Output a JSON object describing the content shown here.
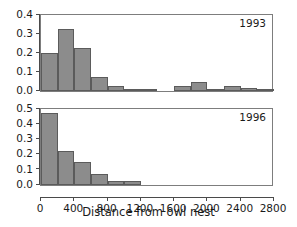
{
  "figure": {
    "xlabel": "Distance from owl nest",
    "bar_color": "#8c8c8c",
    "bar_edge_color": "#5b5b5b",
    "axis_color": "#4a4a4a",
    "text_color": "#1a1a1a"
  },
  "xaxis": {
    "min": 0,
    "max": 2800,
    "bin_width": 200,
    "tick_values": [
      0,
      400,
      800,
      1200,
      1600,
      2000,
      2400,
      2800
    ],
    "tick_labels": [
      "0",
      "400",
      "800",
      "1200",
      "1600",
      "2000",
      "2400",
      "2800"
    ]
  },
  "panels": [
    {
      "id": "1993",
      "annotation": "1993",
      "ylim": [
        0,
        0.4
      ],
      "ytick_values": [
        0.0,
        0.1,
        0.2,
        0.3,
        0.4
      ],
      "ytick_labels": [
        "0.0",
        "0.1",
        "0.2",
        "0.3",
        "0.4"
      ]
    },
    {
      "id": "1996",
      "annotation": "1996",
      "ylim": [
        0,
        0.5
      ],
      "ytick_values": [
        0.0,
        0.1,
        0.2,
        0.3,
        0.4,
        0.5
      ],
      "ytick_labels": [
        "0.0",
        "0.1",
        "0.2",
        "0.3",
        "0.4",
        "0.5"
      ]
    }
  ],
  "chart_data": [
    {
      "type": "bar",
      "title": "1993",
      "xlabel": "Distance from owl nest",
      "ylabel": "",
      "xlim": [
        0,
        2800
      ],
      "ylim": [
        0,
        0.4
      ],
      "grid": false,
      "legend": "none",
      "bin_width": 200,
      "bin_starts": [
        0,
        200,
        400,
        600,
        800,
        1000,
        1200,
        1400,
        1600,
        1800,
        2000,
        2200,
        2400,
        2600
      ],
      "categories": [
        "0-200",
        "200-400",
        "400-600",
        "600-800",
        "800-1000",
        "1000-1200",
        "1200-1400",
        "1400-1600",
        "1600-1800",
        "1800-2000",
        "2000-2200",
        "2200-2400",
        "2400-2600",
        "2600-2800"
      ],
      "values": [
        0.2,
        0.325,
        0.225,
        0.075,
        0.025,
        0.0125,
        0.0125,
        0.0,
        0.025,
        0.05,
        0.0125,
        0.025,
        0.0175,
        0.01
      ],
      "xtick_labels": [
        "0",
        "400",
        "800",
        "1200",
        "1600",
        "2000",
        "2400",
        "2800"
      ],
      "ytick_labels": [
        "0.0",
        "0.1",
        "0.2",
        "0.3",
        "0.4"
      ]
    },
    {
      "type": "bar",
      "title": "1996",
      "xlabel": "Distance from owl nest",
      "ylabel": "",
      "xlim": [
        0,
        2800
      ],
      "ylim": [
        0,
        0.5
      ],
      "grid": false,
      "legend": "none",
      "bin_width": 200,
      "bin_starts": [
        0,
        200,
        400,
        600,
        800,
        1000
      ],
      "categories": [
        "0-200",
        "200-400",
        "400-600",
        "600-800",
        "800-1000",
        "1000-1200"
      ],
      "values": [
        0.475,
        0.225,
        0.15,
        0.075,
        0.025,
        0.025
      ],
      "xtick_labels": [
        "0",
        "400",
        "800",
        "1200",
        "1600",
        "2000",
        "2400",
        "2800"
      ],
      "ytick_labels": [
        "0.0",
        "0.1",
        "0.2",
        "0.3",
        "0.4",
        "0.5"
      ]
    }
  ]
}
